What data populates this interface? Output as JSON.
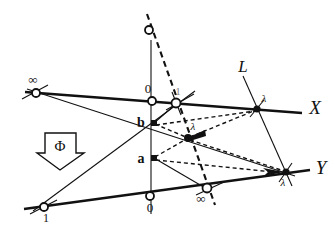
{
  "figure": {
    "background_color": "#ffffff",
    "ink_color": "#111111",
    "width": 335,
    "height": 233
  },
  "axes": {
    "x_axis": {
      "label": "ℰ",
      "label_text": "X",
      "points": [
        {
          "name": "infinity",
          "label": "∞",
          "marker": "open-circle",
          "x": 36,
          "y": 93
        },
        {
          "name": "zero",
          "label": "0",
          "marker": "open-circle",
          "x": 152,
          "y": 101
        },
        {
          "name": "one",
          "label": "1",
          "marker": "open-circle",
          "x": 176,
          "y": 103
        },
        {
          "name": "lambda",
          "label": "λ",
          "marker": "filled-circle",
          "x": 257,
          "y": 109
        }
      ]
    },
    "y_axis": {
      "label": "ᵎ",
      "label_text": "Y",
      "points": [
        {
          "name": "one",
          "label": "1",
          "marker": "open-circle",
          "x": 44,
          "y": 207
        },
        {
          "name": "zero",
          "label": "0",
          "marker": "open-circle",
          "x": 150,
          "y": 196
        },
        {
          "name": "infinity",
          "label": "∞",
          "marker": "open-circle",
          "x": 206,
          "y": 189
        },
        {
          "name": "lambda",
          "label": "λ",
          "marker": "filled-circle",
          "x": 286,
          "y": 172
        }
      ]
    }
  },
  "points": {
    "a": {
      "label": "a",
      "marker": "filled-square",
      "x": 154,
      "y": 158
    },
    "b": {
      "label": "b",
      "marker": "filled-square",
      "x": 154,
      "y": 123
    },
    "lambda_center": {
      "label": "λ",
      "marker": "filled-circle",
      "x": 188,
      "y": 138
    },
    "top_vertex": {
      "label": "",
      "marker": "open-circle",
      "x": 149,
      "y": 30
    }
  },
  "lines": {
    "script_L": {
      "label": "ℒ",
      "label_text": "L"
    }
  },
  "annotation": {
    "map_arrow": {
      "label": "Φ",
      "shape": "down-block-arrow"
    }
  }
}
